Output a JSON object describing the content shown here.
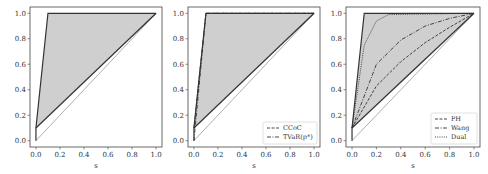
{
  "chart_data": [
    {
      "type": "area",
      "title": "",
      "xlabel": "s",
      "ylabel": "",
      "xlim": [
        0,
        1
      ],
      "ylim": [
        0,
        1
      ],
      "xticks": [
        "0.0",
        "0.2",
        "0.4",
        "0.6",
        "0.8",
        "1.0"
      ],
      "yticks": [
        "0.0",
        "0.2",
        "0.4",
        "0.6",
        "0.8",
        "1.0"
      ],
      "grid": false,
      "shaded_region": {
        "upper": [
          [
            0,
            0.1
          ],
          [
            0.1,
            1.0
          ],
          [
            1.0,
            1.0
          ]
        ],
        "lower": [
          [
            0,
            0.1
          ],
          [
            1.0,
            1.0
          ]
        ]
      },
      "series": [
        {
          "name": "upper bound",
          "style": "solid",
          "points": [
            [
              0,
              0
            ],
            [
              0,
              0.1
            ],
            [
              0.1,
              1.0
            ],
            [
              1.0,
              1.0
            ]
          ]
        },
        {
          "name": "lower bound",
          "style": "solid",
          "points": [
            [
              0,
              0
            ],
            [
              0,
              0.1
            ],
            [
              1.0,
              1.0
            ]
          ]
        },
        {
          "name": "identity",
          "style": "solid-thin",
          "points": [
            [
              0,
              0
            ],
            [
              1.0,
              1.0
            ]
          ]
        }
      ],
      "legend": []
    },
    {
      "type": "area",
      "title": "",
      "xlabel": "s",
      "ylabel": "",
      "xlim": [
        0,
        1
      ],
      "ylim": [
        0,
        1
      ],
      "xticks": [
        "0.0",
        "0.2",
        "0.4",
        "0.6",
        "0.8",
        "1.0"
      ],
      "yticks": [
        "0.0",
        "0.2",
        "0.4",
        "0.6",
        "0.8",
        "1.0"
      ],
      "grid": false,
      "series": [
        {
          "name": "CCoC",
          "style": "dashed",
          "points": [
            [
              0,
              0.1
            ],
            [
              0.1,
              1.0
            ],
            [
              1.0,
              1.0
            ]
          ]
        },
        {
          "name": "TVaR(p*)",
          "style": "dashdot",
          "points": [
            [
              0,
              0
            ],
            [
              0.1,
              1.0
            ],
            [
              1.0,
              1.0
            ]
          ]
        },
        {
          "name": "lower bound",
          "style": "solid",
          "points": [
            [
              0,
              0.1
            ],
            [
              1.0,
              1.0
            ]
          ]
        },
        {
          "name": "identity",
          "style": "solid-thin",
          "points": [
            [
              0,
              0
            ],
            [
              1.0,
              1.0
            ]
          ]
        }
      ],
      "legend": [
        "CCoC",
        "TVaR(p*)"
      ],
      "legend_position": "lower right"
    },
    {
      "type": "area",
      "title": "",
      "xlabel": "s",
      "ylabel": "",
      "xlim": [
        0,
        1
      ],
      "ylim": [
        0,
        1
      ],
      "xticks": [
        "0.0",
        "0.2",
        "0.4",
        "0.6",
        "0.8",
        "1.0"
      ],
      "yticks": [
        "0.0",
        "0.2",
        "0.4",
        "0.6",
        "0.8",
        "1.0"
      ],
      "grid": false,
      "series": [
        {
          "name": "PH",
          "style": "dashed",
          "points": [
            [
              0,
              0.1
            ],
            [
              0.2,
              0.43
            ],
            [
              0.4,
              0.62
            ],
            [
              0.6,
              0.77
            ],
            [
              0.8,
              0.89
            ],
            [
              1.0,
              1.0
            ]
          ]
        },
        {
          "name": "Wang",
          "style": "dashdot",
          "points": [
            [
              0,
              0.1
            ],
            [
              0.2,
              0.6
            ],
            [
              0.4,
              0.79
            ],
            [
              0.6,
              0.9
            ],
            [
              0.8,
              0.96
            ],
            [
              1.0,
              1.0
            ]
          ]
        },
        {
          "name": "Dual",
          "style": "dotted",
          "points": [
            [
              0,
              0.1
            ],
            [
              0.1,
              0.75
            ],
            [
              0.2,
              0.94
            ],
            [
              0.3,
              0.99
            ],
            [
              1.0,
              1.0
            ]
          ]
        }
      ],
      "legend": [
        "PH",
        "Wang",
        "Dual"
      ],
      "legend_position": "lower right"
    }
  ],
  "panels": [
    {
      "xlabel": "s",
      "legend": []
    },
    {
      "xlabel": "s",
      "legend": [
        {
          "label": "CCoC",
          "style": "dashed"
        },
        {
          "label": "TVaR(p*)",
          "style": "dashdot"
        }
      ]
    },
    {
      "xlabel": "s",
      "legend": [
        {
          "label": "PH",
          "style": "dashed"
        },
        {
          "label": "Wang",
          "style": "dashdot"
        },
        {
          "label": "Dual",
          "style": "dotted"
        }
      ]
    }
  ],
  "ticks": [
    "0.0",
    "0.2",
    "0.4",
    "0.6",
    "0.8",
    "1.0"
  ],
  "colors": {
    "fill": "#cfcfcf",
    "line": "#333333",
    "thin": "#777777",
    "axis": "#444444"
  }
}
